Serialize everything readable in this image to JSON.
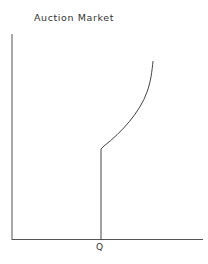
{
  "diagram": {
    "title": "Auction Market",
    "x_marker_label": "Q",
    "line_color": "#444444",
    "elements": [
      {
        "type": "axis",
        "name": "vertical-axis"
      },
      {
        "type": "axis",
        "name": "horizontal-axis"
      },
      {
        "type": "line",
        "name": "vertical-supply-segment",
        "at": "Q"
      },
      {
        "type": "curve",
        "name": "rising-curve",
        "description": "convex upward curve rising from top of vertical segment"
      }
    ]
  }
}
